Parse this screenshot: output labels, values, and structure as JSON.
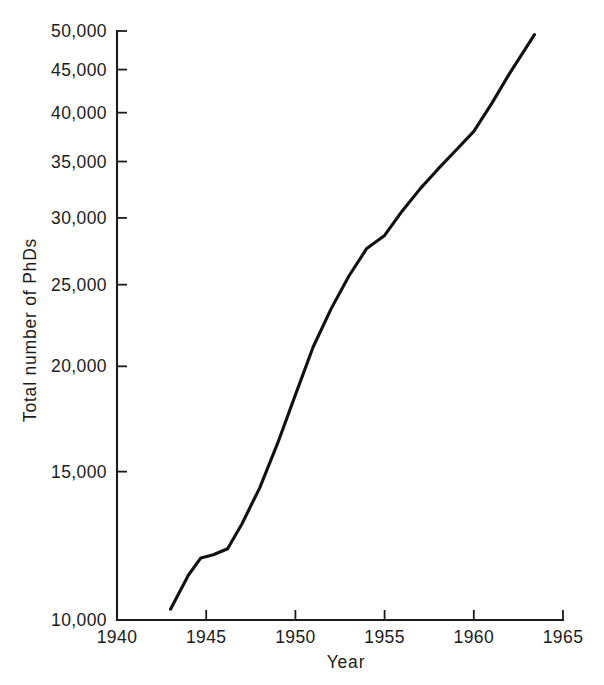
{
  "chart_data": {
    "type": "line",
    "title": "",
    "xlabel": "Year",
    "ylabel": "Total number of PhDs",
    "xlim": [
      1940,
      1965
    ],
    "ylim": [
      10000,
      50000
    ],
    "yscale": "log",
    "xscale": "linear",
    "grid": false,
    "legend": null,
    "xticks": [
      1940,
      1945,
      1950,
      1955,
      1960,
      1965
    ],
    "xticklabels": [
      "1940",
      "1945",
      "1950",
      "1955",
      "1960",
      "1965"
    ],
    "yticks": [
      10000,
      15000,
      20000,
      25000,
      30000,
      35000,
      40000,
      45000,
      50000
    ],
    "yticklabels": [
      "10,000",
      "15,000",
      "20,000",
      "25,000",
      "30,000",
      "35,000",
      "40,000",
      "45,000",
      "50,000"
    ],
    "series": [
      {
        "name": "Total number of PhDs",
        "color": "#111111",
        "x": [
          1943.0,
          1944.0,
          1944.7,
          1945.4,
          1946.2,
          1947.0,
          1948.0,
          1949.0,
          1950.0,
          1951.0,
          1952.0,
          1953.0,
          1954.0,
          1955.0,
          1956.0,
          1957.0,
          1958.0,
          1959.0,
          1960.0,
          1961.0,
          1962.0,
          1963.4
        ],
        "y": [
          10300,
          11300,
          11850,
          11950,
          12150,
          13000,
          14350,
          16200,
          18500,
          21100,
          23400,
          25600,
          27600,
          28600,
          30600,
          32500,
          34300,
          36100,
          38000,
          41000,
          44500,
          49500
        ]
      }
    ]
  },
  "axis_labels": {
    "x_title": "Year",
    "y_title": "Total number of PhDs"
  }
}
